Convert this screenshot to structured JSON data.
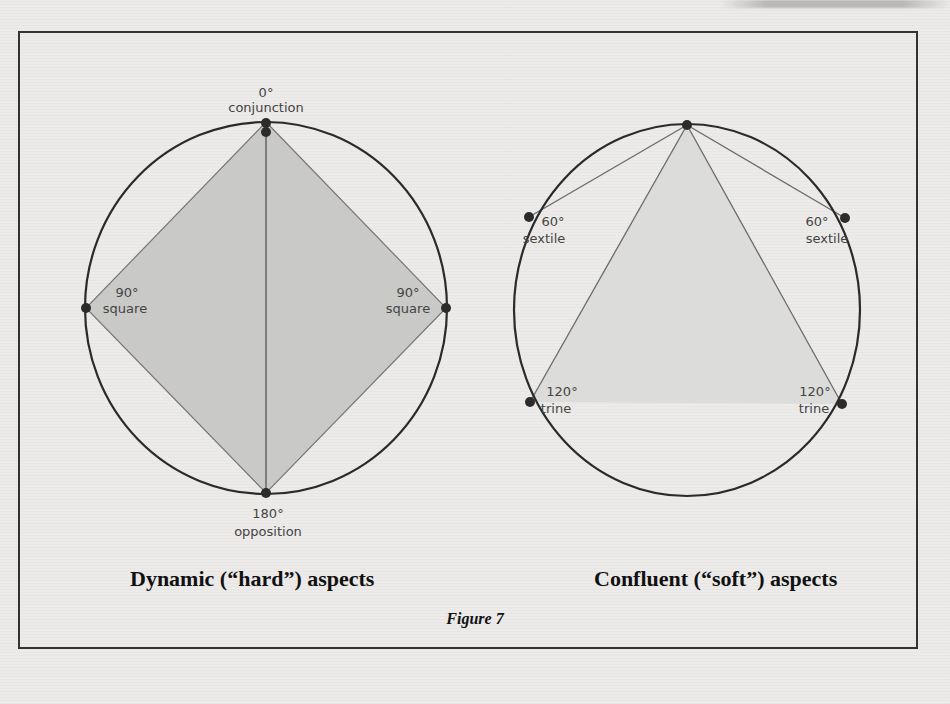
{
  "figure": {
    "number_label": "Figure 7",
    "left_panel": {
      "caption": "Dynamic (“hard”) aspects",
      "points": [
        {
          "degree": "0°",
          "name": "conjunction"
        },
        {
          "degree": "90°",
          "name": "square",
          "side": "left"
        },
        {
          "degree": "90°",
          "name": "square",
          "side": "right"
        },
        {
          "degree": "180°",
          "name": "opposition"
        }
      ]
    },
    "right_panel": {
      "caption": "Confluent (“soft”) aspects",
      "points": [
        {
          "degree": "60°",
          "name": "sextile",
          "side": "left"
        },
        {
          "degree": "60°",
          "name": "sextile",
          "side": "right"
        },
        {
          "degree": "120°",
          "name": "trine",
          "side": "left"
        },
        {
          "degree": "120°",
          "name": "trine",
          "side": "right"
        }
      ]
    }
  },
  "colors": {
    "circle_stroke": "#2a2a2a",
    "line_stroke": "#6a6a6a",
    "fill_shade": "#c9c9c7",
    "fill_shade_light": "#dcdcda",
    "dot": "#2b2b2b",
    "label_text": "#444444"
  }
}
